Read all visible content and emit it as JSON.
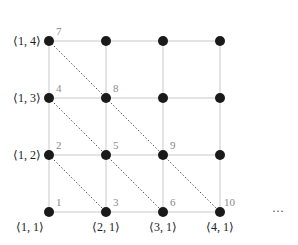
{
  "diagram": {
    "nodes": [
      {
        "id": 1,
        "label": "1",
        "pair": [
          1,
          1
        ]
      },
      {
        "id": 2,
        "label": "2",
        "pair": [
          1,
          2
        ]
      },
      {
        "id": 3,
        "label": "3",
        "pair": [
          2,
          1
        ]
      },
      {
        "id": 4,
        "label": "4",
        "pair": [
          1,
          3
        ]
      },
      {
        "id": 5,
        "label": "5",
        "pair": [
          2,
          2
        ]
      },
      {
        "id": 6,
        "label": "6",
        "pair": [
          3,
          1
        ]
      },
      {
        "id": 7,
        "label": "7",
        "pair": [
          1,
          4
        ]
      },
      {
        "id": 8,
        "label": "8",
        "pair": [
          2,
          3
        ]
      },
      {
        "id": 9,
        "label": "9",
        "pair": [
          3,
          2
        ]
      },
      {
        "id": 10,
        "label": "10",
        "pair": [
          4,
          1
        ]
      }
    ],
    "row_labels": [
      "⟨1, 4⟩",
      "⟨1, 3⟩",
      "⟨1, 2⟩"
    ],
    "col_labels": [
      "⟨1, 1⟩",
      "⟨2, 1⟩",
      "⟨3, 1⟩",
      "⟨4, 1⟩"
    ],
    "ellipsis": "···",
    "grid_size": 4,
    "colors": {
      "node": "#1a1a1a",
      "grid": "#c8c8c8",
      "number": "#8a8a8a",
      "diagonal": "#555555"
    }
  },
  "labels": {
    "n1": "1",
    "n2": "2",
    "n3": "3",
    "n4": "4",
    "n5": "5",
    "n6": "6",
    "n7": "7",
    "n8": "8",
    "n9": "9",
    "n10": "10",
    "r14": "⟨1, 4⟩",
    "r13": "⟨1, 3⟩",
    "r12": "⟨1, 2⟩",
    "c11": "⟨1, 1⟩",
    "c21": "⟨2, 1⟩",
    "c31": "⟨3, 1⟩",
    "c41": "⟨4, 1⟩",
    "ellipsis": "···"
  }
}
